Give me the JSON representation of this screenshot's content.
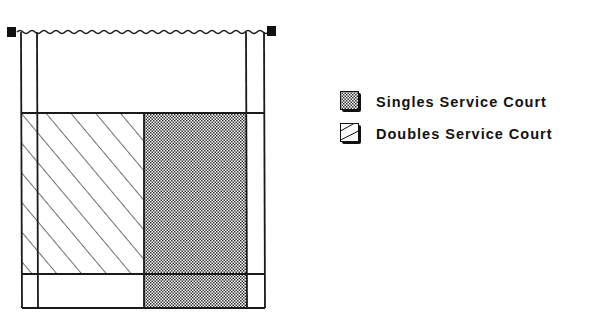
{
  "diagram": {
    "colors": {
      "line": "#1a1a1a",
      "background": "#ffffff",
      "dot_pattern": "#333333"
    }
  },
  "legend": {
    "items": [
      {
        "label": "Singles Service Court",
        "pattern": "dotted",
        "icon": "dotted-swatch-icon"
      },
      {
        "label": "Doubles Service Court",
        "pattern": "hatched",
        "icon": "hatched-swatch-icon"
      }
    ]
  }
}
